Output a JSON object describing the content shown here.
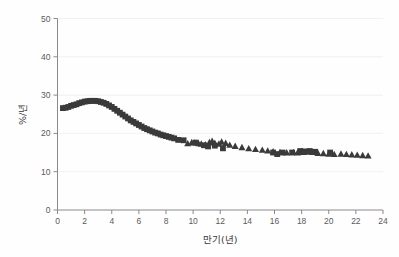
{
  "chart_data": {
    "type": "scatter",
    "title": "",
    "xlabel": "만기(년)",
    "ylabel": "%/년",
    "xlim": [
      0,
      24
    ],
    "ylim": [
      0,
      50
    ],
    "xticks": [
      0,
      2,
      4,
      6,
      8,
      10,
      12,
      14,
      16,
      18,
      20,
      22,
      24
    ],
    "yticks": [
      0,
      10,
      20,
      30,
      40,
      50
    ],
    "grid": "horizontal",
    "legend": "none",
    "marker_color": "#3a3a3a",
    "series": [
      {
        "name": "square-series",
        "marker": "square",
        "points": [
          [
            0.4,
            26.6
          ],
          [
            0.6,
            26.7
          ],
          [
            0.8,
            26.9
          ],
          [
            1.0,
            27.2
          ],
          [
            1.2,
            27.4
          ],
          [
            1.4,
            27.6
          ],
          [
            1.6,
            27.9
          ],
          [
            1.8,
            28.1
          ],
          [
            2.0,
            28.3
          ],
          [
            2.2,
            28.4
          ],
          [
            2.4,
            28.5
          ],
          [
            2.6,
            28.5
          ],
          [
            2.8,
            28.5
          ],
          [
            3.0,
            28.4
          ],
          [
            3.2,
            28.2
          ],
          [
            3.4,
            28.0
          ],
          [
            3.6,
            27.7
          ],
          [
            3.8,
            27.3
          ],
          [
            4.0,
            26.9
          ],
          [
            4.2,
            26.4
          ],
          [
            4.4,
            25.9
          ],
          [
            4.6,
            25.4
          ],
          [
            4.8,
            24.9
          ],
          [
            5.0,
            24.4
          ],
          [
            5.2,
            23.9
          ],
          [
            5.4,
            23.4
          ],
          [
            5.6,
            23.0
          ],
          [
            5.8,
            22.6
          ],
          [
            6.0,
            22.2
          ],
          [
            6.2,
            21.8
          ],
          [
            6.4,
            21.4
          ],
          [
            6.6,
            21.1
          ],
          [
            6.8,
            20.8
          ],
          [
            7.0,
            20.5
          ],
          [
            7.2,
            20.2
          ],
          [
            7.4,
            20.0
          ],
          [
            7.6,
            19.7
          ],
          [
            7.8,
            19.5
          ],
          [
            8.0,
            19.3
          ],
          [
            8.2,
            19.1
          ],
          [
            8.4,
            18.9
          ],
          [
            8.6,
            18.7
          ],
          [
            8.9,
            18.3
          ],
          [
            9.3,
            18.2
          ],
          [
            10.2,
            17.6
          ],
          [
            10.8,
            16.9
          ],
          [
            11.1,
            16.6
          ],
          [
            11.6,
            16.8
          ],
          [
            12.2,
            16.1
          ],
          [
            15.9,
            15.0
          ],
          [
            16.2,
            14.6
          ],
          [
            16.6,
            15.0
          ],
          [
            17.3,
            15.0
          ],
          [
            17.9,
            15.4
          ],
          [
            18.2,
            15.3
          ],
          [
            18.6,
            15.4
          ],
          [
            19.0,
            15.2
          ],
          [
            20.1,
            15.0
          ]
        ]
      },
      {
        "name": "triangle-series",
        "marker": "triangle",
        "points": [
          [
            9.6,
            17.3
          ],
          [
            9.9,
            17.6
          ],
          [
            10.1,
            17.5
          ],
          [
            10.4,
            17.3
          ],
          [
            10.6,
            17.2
          ],
          [
            10.9,
            17.0
          ],
          [
            11.2,
            17.6
          ],
          [
            11.4,
            17.9
          ],
          [
            11.6,
            17.4
          ],
          [
            11.9,
            17.2
          ],
          [
            12.1,
            17.7
          ],
          [
            12.4,
            17.4
          ],
          [
            12.7,
            16.9
          ],
          [
            13.1,
            16.6
          ],
          [
            13.6,
            16.3
          ],
          [
            14.1,
            16.0
          ],
          [
            14.6,
            15.8
          ],
          [
            15.1,
            15.6
          ],
          [
            15.5,
            15.4
          ],
          [
            15.9,
            15.2
          ],
          [
            16.4,
            15.0
          ],
          [
            16.9,
            14.9
          ],
          [
            17.4,
            15.0
          ],
          [
            17.7,
            14.9
          ],
          [
            18.1,
            15.0
          ],
          [
            18.4,
            15.1
          ],
          [
            18.8,
            15.0
          ],
          [
            19.2,
            14.8
          ],
          [
            19.6,
            14.7
          ],
          [
            20.0,
            14.6
          ],
          [
            20.4,
            14.5
          ],
          [
            20.9,
            14.6
          ],
          [
            21.3,
            14.5
          ],
          [
            21.7,
            14.4
          ],
          [
            22.1,
            14.3
          ],
          [
            22.5,
            14.2
          ],
          [
            22.9,
            14.1
          ]
        ]
      }
    ]
  },
  "axes": {
    "y_title": "%/년",
    "x_title": "만기(년)",
    "y_tick_labels": [
      "0",
      "10",
      "20",
      "30",
      "40",
      "50"
    ],
    "x_tick_labels": [
      "0",
      "2",
      "4",
      "6",
      "8",
      "10",
      "12",
      "14",
      "16",
      "18",
      "20",
      "22",
      "24"
    ]
  }
}
